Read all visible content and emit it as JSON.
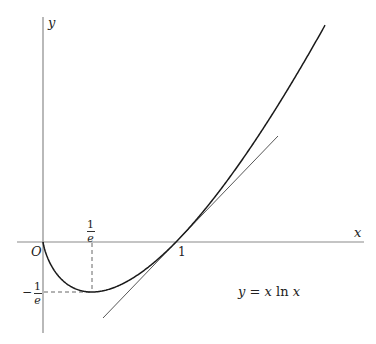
{
  "chart_data": {
    "type": "line",
    "title": "",
    "function": "y = x ln x",
    "xlabel": "x",
    "ylabel": "y",
    "origin_label": "O",
    "series": [
      {
        "name": "y = x ln x",
        "x": [
          0,
          0.05,
          0.1,
          0.2,
          0.3679,
          0.5,
          0.75,
          1,
          1.25,
          1.5,
          1.75,
          2.0
        ],
        "values": [
          0,
          -0.15,
          -0.23,
          -0.322,
          -0.3679,
          -0.347,
          -0.216,
          0,
          0.279,
          0.608,
          0.979,
          1.386
        ]
      },
      {
        "name": "tangent at x=1: y = x - 1",
        "x": [
          0.45,
          1.75
        ],
        "values": [
          -0.55,
          0.75
        ]
      }
    ],
    "annotations": [
      {
        "label": "1/e",
        "x": 0.3679,
        "position": "x-axis tick"
      },
      {
        "label": "-1/e",
        "y": -0.3679,
        "position": "y-axis tick"
      },
      {
        "label": "1",
        "x": 1,
        "position": "x-axis tick"
      },
      {
        "label": "minimum point (1/e, -1/e) with dashed guides"
      }
    ],
    "grid": false,
    "legend": "none"
  },
  "labels": {
    "y_axis": "y",
    "x_axis": "x",
    "origin": "O",
    "one": "1",
    "frac_num": "1",
    "frac_den": "e",
    "minus": "−",
    "equation_lhs": "y",
    "equation_eq": " = ",
    "equation_rhs_x1": "x",
    "equation_ln": " ln ",
    "equation_rhs_x2": "x"
  },
  "colors": {
    "axis": "#8a8a8a",
    "curve": "#1a1a1a",
    "tangent": "#444444",
    "guide": "#555555"
  }
}
